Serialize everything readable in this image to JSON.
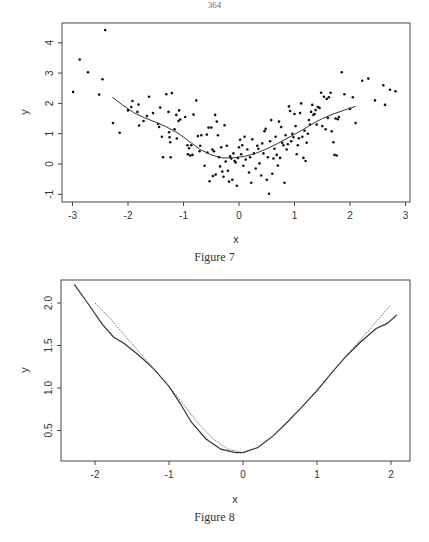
{
  "page": {
    "number": "364"
  },
  "chart_data": [
    {
      "type": "scatter",
      "title": "",
      "caption": "Figure 7",
      "xlabel": "x",
      "ylabel": "y",
      "xlim": [
        -3.2,
        3.1
      ],
      "ylim": [
        -1.25,
        4.7
      ],
      "xticks": [
        -3,
        -2,
        -1,
        0,
        1,
        2,
        3
      ],
      "yticks": [
        -1,
        0,
        1,
        2,
        3,
        4
      ],
      "grid": false,
      "legend": null,
      "series": [
        {
          "name": "observations",
          "kind": "points",
          "points": [
            [
              -2.99,
              2.38
            ],
            [
              -2.87,
              3.45
            ],
            [
              -2.72,
              3.03
            ],
            [
              -2.52,
              2.29
            ],
            [
              -2.46,
              2.8
            ],
            [
              -2.41,
              4.42
            ],
            [
              -2.27,
              1.35
            ],
            [
              -2.15,
              1.03
            ],
            [
              -2.0,
              1.77
            ],
            [
              -1.94,
              1.88
            ],
            [
              -1.92,
              2.08
            ],
            [
              -1.83,
              1.72
            ],
            [
              -1.81,
              1.96
            ],
            [
              -1.8,
              1.27
            ],
            [
              -1.72,
              1.42
            ],
            [
              -1.66,
              1.58
            ],
            [
              -1.62,
              2.22
            ],
            [
              -1.55,
              1.68
            ],
            [
              -1.46,
              1.32
            ],
            [
              -1.44,
              1.22
            ],
            [
              -1.42,
              1.86
            ],
            [
              -1.39,
              0.9
            ],
            [
              -1.37,
              0.22
            ],
            [
              -1.31,
              2.3
            ],
            [
              -1.27,
              1.72
            ],
            [
              -1.26,
              1.05
            ],
            [
              -1.25,
              0.88
            ],
            [
              -1.24,
              0.72
            ],
            [
              -1.23,
              0.22
            ],
            [
              -1.21,
              2.34
            ],
            [
              -1.16,
              1.15
            ],
            [
              -1.13,
              1.62
            ],
            [
              -1.12,
              0.84
            ],
            [
              -1.09,
              1.42
            ],
            [
              -1.08,
              1.77
            ],
            [
              -1.06,
              1.47
            ],
            [
              -0.97,
              1.55
            ],
            [
              -0.93,
              0.62
            ],
            [
              -0.92,
              0.32
            ],
            [
              -0.9,
              0.52
            ],
            [
              -0.88,
              0.28
            ],
            [
              -0.86,
              0.62
            ],
            [
              -0.84,
              0.3
            ],
            [
              -0.82,
              1.63
            ],
            [
              -0.77,
              2.1
            ],
            [
              -0.74,
              0.92
            ],
            [
              -0.71,
              0.42
            ],
            [
              -0.7,
              0.6
            ],
            [
              -0.68,
              0.95
            ],
            [
              -0.62,
              -0.06
            ],
            [
              -0.58,
              0.97
            ],
            [
              -0.57,
              0.38
            ],
            [
              -0.55,
              1.2
            ],
            [
              -0.53,
              -0.57
            ],
            [
              -0.5,
              1.2
            ],
            [
              -0.48,
              0.48
            ],
            [
              -0.47,
              -0.4
            ],
            [
              -0.45,
              0.42
            ],
            [
              -0.43,
              1.62
            ],
            [
              -0.42,
              -0.35
            ],
            [
              -0.4,
              1.4
            ],
            [
              -0.38,
              0.95
            ],
            [
              -0.36,
              0.22
            ],
            [
              -0.34,
              -0.08
            ],
            [
              -0.32,
              0.55
            ],
            [
              -0.3,
              -0.25
            ],
            [
              -0.28,
              -0.42
            ],
            [
              -0.26,
              1.28
            ],
            [
              -0.24,
              0.08
            ],
            [
              -0.22,
              0.6
            ],
            [
              -0.2,
              -0.22
            ],
            [
              -0.18,
              -0.58
            ],
            [
              -0.16,
              0.25
            ],
            [
              -0.14,
              0.18
            ],
            [
              -0.12,
              -0.52
            ],
            [
              -0.1,
              0.35
            ],
            [
              -0.08,
              0.1
            ],
            [
              -0.06,
              0.05
            ],
            [
              -0.04,
              -0.72
            ],
            [
              -0.02,
              0.2
            ],
            [
              0.0,
              0.55
            ],
            [
              0.02,
              0.8
            ],
            [
              0.04,
              0.32
            ],
            [
              0.06,
              0.62
            ],
            [
              0.08,
              -0.06
            ],
            [
              0.1,
              0.9
            ],
            [
              0.12,
              0.15
            ],
            [
              0.15,
              0.48
            ],
            [
              0.18,
              -0.28
            ],
            [
              0.2,
              0.22
            ],
            [
              0.22,
              -0.62
            ],
            [
              0.24,
              0.82
            ],
            [
              0.27,
              0.35
            ],
            [
              0.3,
              -0.15
            ],
            [
              0.33,
              0.6
            ],
            [
              0.35,
              0.5
            ],
            [
              0.37,
              0.02
            ],
            [
              0.4,
              -0.38
            ],
            [
              0.42,
              0.68
            ],
            [
              0.44,
              0.35
            ],
            [
              0.46,
              1.08
            ],
            [
              0.48,
              1.16
            ],
            [
              0.5,
              -0.52
            ],
            [
              0.52,
              0.22
            ],
            [
              0.54,
              -0.98
            ],
            [
              0.56,
              0.75
            ],
            [
              0.58,
              1.45
            ],
            [
              0.6,
              -0.32
            ],
            [
              0.62,
              0.18
            ],
            [
              0.64,
              0.5
            ],
            [
              0.66,
              0.9
            ],
            [
              0.68,
              0.3
            ],
            [
              0.7,
              -0.05
            ],
            [
              0.72,
              1.4
            ],
            [
              0.74,
              0.2
            ],
            [
              0.76,
              1.22
            ],
            [
              0.78,
              0.7
            ],
            [
              0.8,
              0.62
            ],
            [
              0.82,
              -0.62
            ],
            [
              0.84,
              0.95
            ],
            [
              0.86,
              0.48
            ],
            [
              0.88,
              0.65
            ],
            [
              0.9,
              1.9
            ],
            [
              0.92,
              1.75
            ],
            [
              0.94,
              0.75
            ],
            [
              0.96,
              1.0
            ],
            [
              0.98,
              0.88
            ],
            [
              1.0,
              1.65
            ],
            [
              1.02,
              1.25
            ],
            [
              1.04,
              0.32
            ],
            [
              1.06,
              0.62
            ],
            [
              1.08,
              0.85
            ],
            [
              1.1,
              1.68
            ],
            [
              1.12,
              2.0
            ],
            [
              1.14,
              0.9
            ],
            [
              1.16,
              0.2
            ],
            [
              1.18,
              1.1
            ],
            [
              1.2,
              0.1
            ],
            [
              1.22,
              0.7
            ],
            [
              1.24,
              1.0
            ],
            [
              1.26,
              1.45
            ],
            [
              1.28,
              1.3
            ],
            [
              1.3,
              1.72
            ],
            [
              1.32,
              1.95
            ],
            [
              1.34,
              1.62
            ],
            [
              1.36,
              1.65
            ],
            [
              1.38,
              1.78
            ],
            [
              1.4,
              1.3
            ],
            [
              1.42,
              1.88
            ],
            [
              1.45,
              1.85
            ],
            [
              1.48,
              2.35
            ],
            [
              1.5,
              1.25
            ],
            [
              1.53,
              2.22
            ],
            [
              1.56,
              1.15
            ],
            [
              1.58,
              2.15
            ],
            [
              1.6,
              1.52
            ],
            [
              1.62,
              2.2
            ],
            [
              1.65,
              2.35
            ],
            [
              1.67,
              1.08
            ],
            [
              1.7,
              0.72
            ],
            [
              1.72,
              0.3
            ],
            [
              1.74,
              1.5
            ],
            [
              1.76,
              0.28
            ],
            [
              1.78,
              1.48
            ],
            [
              1.8,
              1.55
            ],
            [
              1.85,
              3.03
            ],
            [
              1.9,
              2.3
            ],
            [
              2.0,
              1.82
            ],
            [
              2.05,
              2.2
            ],
            [
              2.1,
              1.35
            ],
            [
              2.22,
              2.75
            ],
            [
              2.33,
              2.82
            ],
            [
              2.45,
              2.1
            ],
            [
              2.6,
              2.6
            ],
            [
              2.63,
              1.95
            ],
            [
              2.72,
              2.45
            ],
            [
              2.82,
              2.4
            ]
          ]
        },
        {
          "name": "smooth fit",
          "kind": "line",
          "x": [
            -2.28,
            -2.1,
            -1.9,
            -1.7,
            -1.5,
            -1.3,
            -1.1,
            -0.9,
            -0.7,
            -0.5,
            -0.3,
            -0.1,
            0.1,
            0.3,
            0.5,
            0.7,
            0.9,
            1.1,
            1.3,
            1.5,
            1.7,
            1.9,
            2.1
          ],
          "y": [
            2.2,
            1.95,
            1.7,
            1.52,
            1.38,
            1.22,
            1.02,
            0.75,
            0.48,
            0.3,
            0.2,
            0.2,
            0.25,
            0.35,
            0.5,
            0.68,
            0.88,
            1.08,
            1.3,
            1.5,
            1.65,
            1.78,
            1.9
          ]
        }
      ]
    },
    {
      "type": "line",
      "title": "",
      "caption": "Figure 8",
      "xlabel": "x",
      "ylabel": "y",
      "xlim": [
        -2.45,
        2.25
      ],
      "ylim": [
        0.15,
        2.3
      ],
      "xticks": [
        -2,
        -1,
        0,
        1,
        2
      ],
      "yticks": [
        0.5,
        1.0,
        1.5,
        2.0
      ],
      "ytick_labels": [
        "0.5",
        "1.0",
        "1.5",
        "2.0"
      ],
      "grid": false,
      "legend": null,
      "series": [
        {
          "name": "estimate (solid)",
          "style": "solid",
          "x": [
            -2.28,
            -2.1,
            -1.9,
            -1.75,
            -1.6,
            -1.4,
            -1.2,
            -1.0,
            -0.85,
            -0.7,
            -0.5,
            -0.3,
            -0.1,
            0.0,
            0.2,
            0.4,
            0.6,
            0.8,
            1.0,
            1.2,
            1.4,
            1.6,
            1.8,
            1.95,
            2.08
          ],
          "y": [
            2.22,
            2.0,
            1.75,
            1.6,
            1.52,
            1.38,
            1.22,
            1.02,
            0.82,
            0.6,
            0.4,
            0.28,
            0.24,
            0.24,
            0.3,
            0.43,
            0.6,
            0.78,
            0.97,
            1.18,
            1.38,
            1.55,
            1.7,
            1.76,
            1.86
          ]
        },
        {
          "name": "true function (dotted)",
          "style": "dotted",
          "x": [
            -2.0,
            -1.8,
            -1.6,
            -1.4,
            -1.2,
            -1.0,
            -0.8,
            -0.6,
            -0.4,
            -0.2,
            0.0,
            0.2,
            0.4,
            0.6,
            0.8,
            1.0,
            1.2,
            1.4,
            1.6,
            1.8,
            2.0
          ],
          "y": [
            2.0,
            1.82,
            1.62,
            1.42,
            1.22,
            1.02,
            0.8,
            0.58,
            0.4,
            0.28,
            0.24,
            0.3,
            0.43,
            0.6,
            0.78,
            0.98,
            1.18,
            1.38,
            1.58,
            1.78,
            1.98
          ]
        }
      ]
    }
  ],
  "figures": [
    {
      "caption": "Figure 7",
      "xlabel": "x",
      "ylabel": "y",
      "xtick_labels": [
        "-3",
        "-2",
        "-1",
        "0",
        "1",
        "2",
        "3"
      ],
      "ytick_labels": [
        "-1",
        "0",
        "1",
        "2",
        "3",
        "4"
      ]
    },
    {
      "caption": "Figure 8",
      "xlabel": "x",
      "ylabel": "y",
      "xtick_labels": [
        "-2",
        "-1",
        "0",
        "1",
        "2"
      ],
      "ytick_labels": [
        "0.5",
        "1.0",
        "1.5",
        "2.0"
      ]
    }
  ]
}
